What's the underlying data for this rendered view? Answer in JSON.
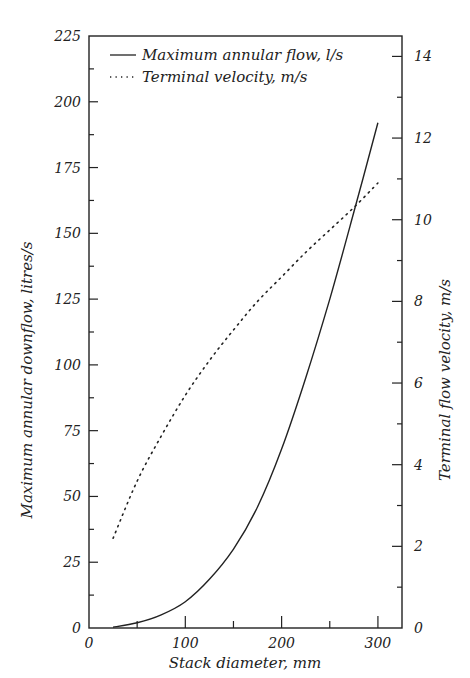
{
  "chart_data": {
    "type": "line",
    "title": "",
    "xlabel": "Stack diameter, mm",
    "ylabel": "Maximum annular downflow, litres/s",
    "y2label": "Terminal flow velocity, m/s",
    "xlim": [
      0,
      325
    ],
    "ylim": [
      0,
      225
    ],
    "y2lim": [
      0,
      14.5
    ],
    "x_ticks": [
      0,
      100,
      200,
      300
    ],
    "x_minor_ticks": [
      50,
      150,
      250
    ],
    "y_ticks": [
      0,
      25,
      50,
      75,
      100,
      125,
      150,
      175,
      200,
      225
    ],
    "y_minor_ticks": [
      12.5,
      37.5,
      62.5,
      87.5,
      112.5,
      137.5,
      162.5,
      187.5,
      212.5
    ],
    "y2_ticks": [
      0,
      2,
      4,
      6,
      8,
      10,
      12,
      14
    ],
    "y2_minor_ticks": [
      1,
      3,
      5,
      7,
      9,
      11,
      13
    ],
    "grid": false,
    "legend_position": "top-left inside",
    "series": [
      {
        "name": "Maximum annular flow, l/s",
        "axis": "left",
        "style": "solid",
        "x": [
          25,
          50,
          75,
          100,
          125,
          150,
          175,
          200,
          225,
          250,
          275,
          300
        ],
        "values": [
          0.3,
          2,
          5,
          10,
          18.5,
          30,
          46,
          68,
          95,
          125,
          158,
          192
        ]
      },
      {
        "name": "Terminal velocity, m/s",
        "axis": "right",
        "style": "dotted",
        "x": [
          25,
          50,
          75,
          100,
          125,
          150,
          175,
          200,
          225,
          250,
          275,
          300
        ],
        "values": [
          2.2,
          3.6,
          4.7,
          5.7,
          6.55,
          7.3,
          8.0,
          8.6,
          9.2,
          9.75,
          10.3,
          10.9
        ]
      }
    ]
  },
  "legend": {
    "items": [
      {
        "symbol": "solid",
        "label": "Maximum annular flow, l/s"
      },
      {
        "symbol": "dotted",
        "label": "Terminal velocity, m/s"
      }
    ]
  },
  "axes": {
    "x_title": "Stack diameter, mm",
    "y_left_title": "Maximum annular downflow, litres/s",
    "y_right_title": "Terminal flow velocity, m/s",
    "x_labels": [
      "0",
      "100",
      "200",
      "300"
    ],
    "y_left_labels": [
      "0",
      "25",
      "50",
      "75",
      "100",
      "125",
      "150",
      "175",
      "200",
      "225"
    ],
    "y_right_labels": [
      "0",
      "2",
      "4",
      "6",
      "8",
      "10",
      "12",
      "14"
    ]
  },
  "colors": {
    "line": "#222222",
    "background": "#ffffff"
  }
}
